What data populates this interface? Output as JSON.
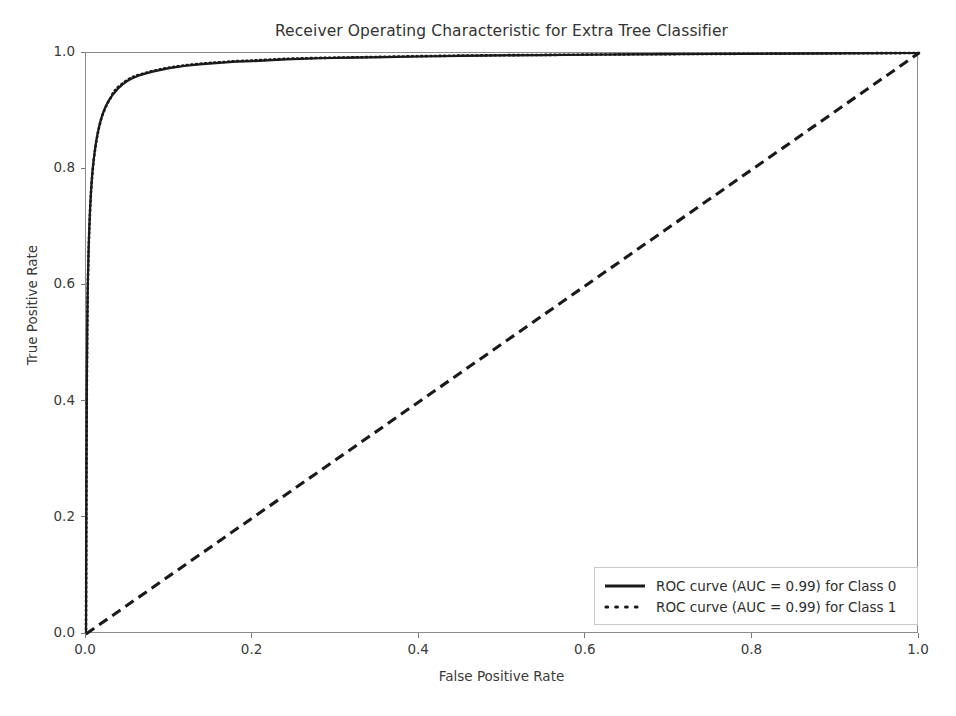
{
  "chart_data": {
    "type": "line",
    "title": "Receiver Operating Characteristic for Extra Tree Classifier",
    "xlabel": "False Positive Rate",
    "ylabel": "True Positive Rate",
    "xlim": [
      0.0,
      1.0
    ],
    "ylim": [
      0.0,
      1.0
    ],
    "grid": false,
    "legend_position": "lower right",
    "xticks": [
      "0.0",
      "0.2",
      "0.4",
      "0.6",
      "0.8",
      "1.0"
    ],
    "xtick_values": [
      0.0,
      0.2,
      0.4,
      0.6,
      0.8,
      1.0
    ],
    "yticks": [
      "0.0",
      "0.2",
      "0.4",
      "0.6",
      "0.8",
      "1.0"
    ],
    "ytick_values": [
      0.0,
      0.2,
      0.4,
      0.6,
      0.8,
      1.0
    ],
    "series": [
      {
        "name": "ROC curve (AUC = 0.99) for Class 0",
        "style": "solid",
        "color": "#1a1a1a",
        "auc": 0.99,
        "class_label": "Class 0",
        "x": [
          0.0,
          0.0005,
          0.001,
          0.0015,
          0.002,
          0.0025,
          0.003,
          0.0035,
          0.004,
          0.0045,
          0.005,
          0.006,
          0.007,
          0.008,
          0.009,
          0.01,
          0.012,
          0.014,
          0.016,
          0.018,
          0.02,
          0.023,
          0.026,
          0.029,
          0.032,
          0.035,
          0.038,
          0.041,
          0.044,
          0.047,
          0.05,
          0.055,
          0.06,
          0.065,
          0.07,
          0.08,
          0.09,
          0.1,
          0.12,
          0.14,
          0.16,
          0.18,
          0.2,
          0.24,
          0.28,
          0.32,
          0.36,
          0.4,
          0.45,
          0.5,
          0.55,
          0.6,
          0.65,
          0.7,
          0.75,
          0.8,
          0.85,
          0.9,
          0.95,
          1.0
        ],
        "y": [
          0.0,
          0.255,
          0.43,
          0.53,
          0.59,
          0.625,
          0.655,
          0.68,
          0.7,
          0.718,
          0.735,
          0.762,
          0.783,
          0.8,
          0.814,
          0.826,
          0.846,
          0.862,
          0.875,
          0.886,
          0.895,
          0.906,
          0.915,
          0.922,
          0.928,
          0.933,
          0.938,
          0.942,
          0.946,
          0.949,
          0.952,
          0.956,
          0.959,
          0.962,
          0.964,
          0.968,
          0.971,
          0.974,
          0.978,
          0.981,
          0.983,
          0.985,
          0.986,
          0.989,
          0.991,
          0.992,
          0.993,
          0.994,
          0.995,
          0.996,
          0.9965,
          0.997,
          0.9975,
          0.998,
          0.9983,
          0.9986,
          0.999,
          0.9993,
          0.9996,
          1.0
        ]
      },
      {
        "name": "ROC curve (AUC = 0.99) for Class 1",
        "style": "dotted",
        "color": "#1a1a1a",
        "auc": 0.99,
        "class_label": "Class 1",
        "x": [
          0.0,
          0.0005,
          0.001,
          0.0015,
          0.002,
          0.0025,
          0.003,
          0.0035,
          0.004,
          0.0045,
          0.005,
          0.006,
          0.007,
          0.008,
          0.009,
          0.01,
          0.012,
          0.014,
          0.016,
          0.018,
          0.02,
          0.023,
          0.026,
          0.029,
          0.032,
          0.035,
          0.038,
          0.041,
          0.044,
          0.047,
          0.05,
          0.055,
          0.06,
          0.065,
          0.07,
          0.08,
          0.09,
          0.1,
          0.12,
          0.14,
          0.16,
          0.18,
          0.2,
          0.24,
          0.28,
          0.32,
          0.36,
          0.4,
          0.45,
          0.5,
          0.55,
          0.6,
          0.65,
          0.7,
          0.75,
          0.8,
          0.85,
          0.9,
          0.95,
          1.0
        ],
        "y": [
          0.0,
          0.25,
          0.425,
          0.525,
          0.586,
          0.622,
          0.652,
          0.677,
          0.698,
          0.716,
          0.733,
          0.76,
          0.781,
          0.798,
          0.812,
          0.824,
          0.845,
          0.861,
          0.874,
          0.885,
          0.894,
          0.905,
          0.914,
          0.921,
          0.93,
          0.936,
          0.941,
          0.944,
          0.948,
          0.951,
          0.954,
          0.958,
          0.961,
          0.963,
          0.965,
          0.969,
          0.972,
          0.975,
          0.979,
          0.982,
          0.984,
          0.986,
          0.987,
          0.99,
          0.9915,
          0.9925,
          0.9935,
          0.9945,
          0.9955,
          0.9962,
          0.9967,
          0.9972,
          0.9977,
          0.9981,
          0.9984,
          0.9987,
          0.9991,
          0.9994,
          0.9997,
          1.0
        ]
      },
      {
        "name": "chance-diagonal",
        "style": "dashed",
        "color": "#1a1a1a",
        "x": [
          0.0,
          1.0
        ],
        "y": [
          0.0,
          1.0
        ]
      }
    ]
  },
  "legend": {
    "entries": [
      {
        "label": "ROC curve (AUC = 0.99) for Class 0",
        "style": "solid"
      },
      {
        "label": "ROC curve (AUC = 0.99) for Class 1",
        "style": "dotted"
      }
    ]
  },
  "colors": {
    "curve": "#1a1a1a",
    "spine": "#8c8c8c",
    "text": "#333333",
    "background": "#ffffff"
  }
}
